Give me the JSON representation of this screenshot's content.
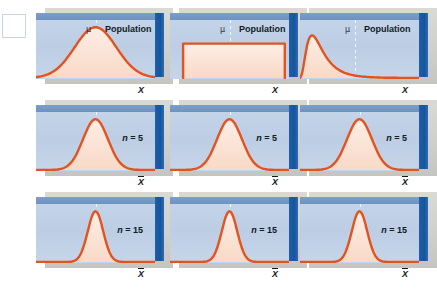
{
  "figure": {
    "rows": [
      {
        "row_id": "population",
        "row_label": "Population",
        "axis_label": "X",
        "axis_has_bar": false,
        "panels": [
          {
            "panel_id": "pop-normal",
            "mu": "μ",
            "label": "Population",
            "shape": "normal"
          },
          {
            "panel_id": "pop-uniform",
            "mu": "μ",
            "label": "Population",
            "shape": "uniform"
          },
          {
            "panel_id": "pop-skewed",
            "mu": "μ",
            "label": "Population",
            "shape": "right-skewed"
          }
        ]
      },
      {
        "row_id": "n5",
        "row_label": "n = 5",
        "axis_label": "X",
        "axis_has_bar": true,
        "panels": [
          {
            "panel_id": "n5-normal",
            "n_prefix": "n",
            "n_eq": " = 5",
            "shape": "normal"
          },
          {
            "panel_id": "n5-uniform",
            "n_prefix": "n",
            "n_eq": " = 5",
            "shape": "normal"
          },
          {
            "panel_id": "n5-skewed",
            "n_prefix": "n",
            "n_eq": " = 5",
            "shape": "normal"
          }
        ]
      },
      {
        "row_id": "n15",
        "row_label": "n = 15",
        "axis_label": "X",
        "axis_has_bar": true,
        "panels": [
          {
            "panel_id": "n15-normal",
            "n_prefix": "n",
            "n_eq": " = 15",
            "shape": "normal-narrow"
          },
          {
            "panel_id": "n15-uniform",
            "n_prefix": "n",
            "n_eq": " = 15",
            "shape": "normal-narrow"
          },
          {
            "panel_id": "n15-skewed",
            "n_prefix": "n",
            "n_eq": " = 15",
            "shape": "normal-narrow"
          }
        ]
      }
    ]
  },
  "chart_data": {
    "type": "line",
    "xlabel": "X",
    "ylabel": "",
    "grid": false,
    "legend": "none",
    "curve_color": "#e1531f",
    "fill_color": "#fbe3d6",
    "panel_color": "#c3d3e8",
    "edge_color": "#1f5fa9",
    "columns": [
      {
        "name": "Normal population",
        "population_shape": "normal"
      },
      {
        "name": "Uniform population",
        "population_shape": "uniform"
      },
      {
        "name": "Right-skewed population",
        "population_shape": "right-skewed"
      }
    ],
    "rows": [
      {
        "name": "Population",
        "axis": "X",
        "n": null
      },
      {
        "name": "n = 5",
        "axis": "X̄",
        "n": 5
      },
      {
        "name": "n = 15",
        "axis": "X̄",
        "n": 15
      }
    ],
    "series": [
      {
        "name": "Normal population (wide bell)",
        "row": "Population",
        "column": "Normal population",
        "shape": "normal",
        "mean_x": 0.5,
        "relative_sd": 0.185,
        "peak_height": 0.8
      },
      {
        "name": "Uniform population (flat)",
        "row": "Population",
        "column": "Uniform population",
        "shape": "uniform",
        "mean_x": 0.5,
        "range": [
          0.1,
          0.9
        ],
        "height": 0.5
      },
      {
        "name": "Right-skewed population",
        "row": "Population",
        "column": "Right-skewed population",
        "shape": "right-skewed",
        "mean_x": 0.42,
        "mode_x": 0.35,
        "peak_height": 0.82
      },
      {
        "name": "Sampling dist. n=5 (normal pop)",
        "row": "n = 5",
        "column": "Normal population",
        "shape": "normal",
        "mean_x": 0.5,
        "relative_sd": 0.105,
        "peak_height": 0.88
      },
      {
        "name": "Sampling dist. n=5 (uniform pop)",
        "row": "n = 5",
        "column": "Uniform population",
        "shape": "normal",
        "mean_x": 0.5,
        "relative_sd": 0.115,
        "peak_height": 0.86
      },
      {
        "name": "Sampling dist. n=5 (skewed pop)",
        "row": "n = 5",
        "column": "Right-skewed population",
        "shape": "normal",
        "mean_x": 0.5,
        "relative_sd": 0.11,
        "peak_height": 0.87
      },
      {
        "name": "Sampling dist. n=15 (normal pop)",
        "row": "n = 15",
        "column": "Normal population",
        "shape": "normal",
        "mean_x": 0.5,
        "relative_sd": 0.065,
        "peak_height": 0.95
      },
      {
        "name": "Sampling dist. n=15 (uniform pop)",
        "row": "n = 15",
        "column": "Uniform population",
        "shape": "normal",
        "mean_x": 0.5,
        "relative_sd": 0.062,
        "peak_height": 0.96
      },
      {
        "name": "Sampling dist. n=15 (skewed pop)",
        "row": "n = 15",
        "column": "Right-skewed population",
        "shape": "normal",
        "mean_x": 0.5,
        "relative_sd": 0.068,
        "peak_height": 0.94
      }
    ],
    "annotations": [
      {
        "text": "μ",
        "row": "Population",
        "placement": "above-center"
      },
      {
        "text": "Population",
        "row": "Population",
        "placement": "upper-right"
      },
      {
        "text": "n = 5",
        "row": "n = 5",
        "placement": "upper-right"
      },
      {
        "text": "n = 15",
        "row": "n = 15",
        "placement": "upper-right"
      },
      {
        "text": "X",
        "row": "Population",
        "placement": "axis-right"
      },
      {
        "text": "X̄",
        "row": "n = 5",
        "placement": "axis-right"
      },
      {
        "text": "X̄",
        "row": "n = 15",
        "placement": "axis-right"
      }
    ]
  }
}
